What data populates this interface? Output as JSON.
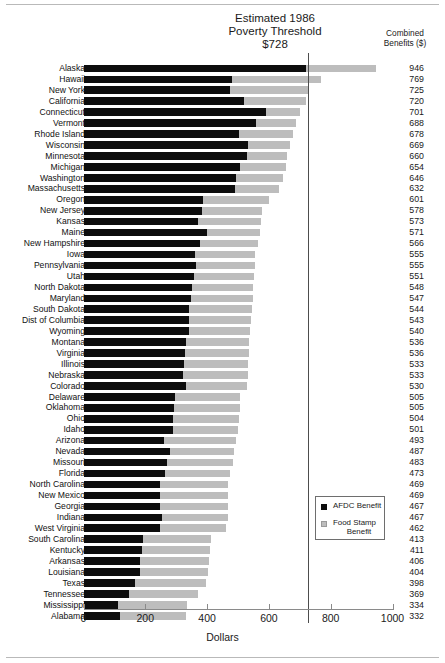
{
  "header": {
    "threshold_line1": "Estimated 1986",
    "threshold_line2": "Poverty Threshold",
    "threshold_line3": "$728",
    "combined_line1": "Combined",
    "combined_line2": "Benefits ($)"
  },
  "legend": {
    "afdc_label": "AFDC Benefit",
    "food_stamp_label_line1": "Food Stamp",
    "food_stamp_label_line2": "Benefit",
    "afdc_color": "#0d0d0d",
    "food_stamp_color": "#bdbdbd"
  },
  "axis": {
    "title": "Dollars",
    "ticks": [
      "0",
      "200",
      "400",
      "600",
      "800",
      "1000"
    ]
  },
  "chart_data": {
    "type": "bar",
    "orientation": "horizontal",
    "stacked": true,
    "title": "Estimated 1986 Poverty Threshold $728",
    "xlabel": "Dollars",
    "ylabel": "",
    "xlim": [
      0,
      1000
    ],
    "xticks": [
      0,
      200,
      400,
      600,
      800,
      1000
    ],
    "grid": false,
    "legend_position": "inside-lower-right",
    "annotations": [
      {
        "type": "vline",
        "value": 728,
        "label": "Estimated 1986 Poverty Threshold $728"
      }
    ],
    "value_column_header": "Combined Benefits ($)",
    "series": [
      {
        "name": "AFDC Benefit",
        "color": "#0d0d0d"
      },
      {
        "name": "Food Stamp Benefit",
        "color": "#bdbdbd"
      }
    ],
    "categories": [
      "Alaska",
      "Hawaii",
      "New York",
      "California",
      "Connecticut",
      "Vermont",
      "Rhode Island",
      "Wisconsin",
      "Minnesota",
      "Michigan",
      "Washington",
      "Massachusetts",
      "Oregon",
      "New Jersey",
      "Kansas",
      "Maine",
      "New Hampshire",
      "Iowa",
      "Pennsylvania",
      "Utah",
      "North Dakota",
      "Maryland",
      "South Dakota",
      "Dist of Columbia",
      "Wyoming",
      "Montana",
      "Virginia",
      "Illinois",
      "Nebraska",
      "Colorado",
      "Delaware",
      "Oklahoma",
      "Ohio",
      "Idaho",
      "Arizona",
      "Nevada",
      "Missouri",
      "Florida",
      "North Carolina",
      "New Mexico",
      "Georgia",
      "Indiana",
      "West Virginia",
      "South Carolina",
      "Kentucky",
      "Arkansas",
      "Louisiana",
      "Texas",
      "Tennessee",
      "Mississippi",
      "Alabama"
    ],
    "combined": [
      946,
      769,
      725,
      720,
      701,
      688,
      678,
      669,
      660,
      654,
      646,
      632,
      601,
      578,
      573,
      571,
      566,
      555,
      555,
      551,
      548,
      547,
      544,
      543,
      540,
      536,
      536,
      533,
      533,
      530,
      505,
      505,
      504,
      501,
      493,
      487,
      483,
      473,
      469,
      469,
      467,
      467,
      462,
      413,
      411,
      406,
      404,
      398,
      369,
      334,
      332
    ],
    "afdc": [
      719,
      482,
      474,
      519,
      592,
      558,
      503,
      533,
      528,
      507,
      492,
      491,
      386,
      385,
      371,
      400,
      378,
      360,
      364,
      358,
      351,
      348,
      343,
      343,
      340,
      331,
      327,
      326,
      323,
      333,
      297,
      292,
      290,
      290,
      261,
      281,
      269,
      263,
      248,
      249,
      246,
      254,
      249,
      194,
      188,
      183,
      184,
      167,
      146,
      112,
      118
    ],
    "food_stamp": [
      227,
      287,
      251,
      201,
      109,
      130,
      175,
      136,
      132,
      147,
      154,
      141,
      215,
      193,
      202,
      171,
      188,
      195,
      191,
      193,
      197,
      199,
      201,
      200,
      200,
      205,
      209,
      207,
      210,
      197,
      208,
      213,
      214,
      211,
      232,
      206,
      214,
      210,
      221,
      220,
      221,
      213,
      213,
      219,
      223,
      223,
      220,
      231,
      223,
      222,
      214
    ]
  }
}
